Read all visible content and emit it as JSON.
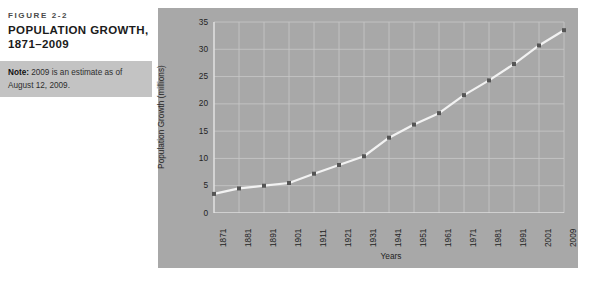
{
  "caption": {
    "figure_label": "FIGURE 2-2",
    "title": "POPULATION GROWTH, 1871–2009",
    "note_lead": "Note:",
    "note_body": " 2009 is an estimate as of August 12, 2009."
  },
  "colors": {
    "page_background": "#ffffff",
    "chart_background": "#a8a8a8",
    "note_band": "#c3c3c3",
    "gridline": "#c8c8c8",
    "axis_line": "#e8e8e8",
    "series_line": "#f2f2f2",
    "marker": "#555555",
    "text": "#242424",
    "title_text": "#1b1b1b"
  },
  "chart_data": {
    "type": "line",
    "title": "POPULATION GROWTH, 1871–2009",
    "xlabel": "Years",
    "ylabel": "Population Growth (millions)",
    "categories": [
      "1871",
      "1881",
      "1891",
      "1901",
      "1911",
      "1921",
      "1931",
      "1941",
      "1951",
      "1961",
      "1971",
      "1981",
      "1991",
      "2001",
      "2009"
    ],
    "values": [
      3.5,
      4.5,
      5.0,
      5.5,
      7.2,
      8.8,
      10.4,
      13.8,
      16.2,
      18.3,
      21.6,
      24.3,
      27.3,
      30.7,
      33.5
    ],
    "ylim": [
      0,
      35
    ],
    "yticks": [
      0,
      5,
      10,
      15,
      20,
      25,
      30,
      35
    ],
    "grid": true,
    "legend": "none",
    "marker": "square"
  }
}
